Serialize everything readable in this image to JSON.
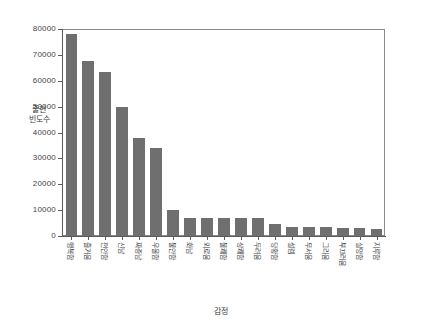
{
  "chart_data": {
    "type": "bar",
    "title": "",
    "xlabel": "감정",
    "ylabel": "출현\n빈도수",
    "ylabel_line1": "출현",
    "ylabel_line2": "빈도수",
    "ylim": [
      0,
      80000
    ],
    "yticks": [
      0,
      10000,
      20000,
      30000,
      40000,
      50000,
      60000,
      70000,
      80000
    ],
    "ytick_labels": [
      "0",
      "10000",
      "20000",
      "30000",
      "40000",
      "50000",
      "60000",
      "70000",
      "80000"
    ],
    "grid": false,
    "legend": "none",
    "bar_color": "#6f6f6f",
    "axis_color": "#5a5a5a",
    "categories": [
      "행복함",
      "즐거움",
      "편안함",
      "신남",
      "짜증남",
      "우울함",
      "불안함",
      "화남",
      "외로움",
      "불쾌함",
      "상쾌함",
      "두려움",
      "당황함",
      "설렘",
      "무서움",
      "그리움",
      "부끄러움",
      "실망함",
      "지루함"
    ],
    "values": [
      78000,
      67500,
      63500,
      50000,
      38000,
      34000,
      10000,
      7000,
      7000,
      7000,
      7000,
      7000,
      4800,
      3500,
      3400,
      3300,
      3200,
      3100,
      2900
    ]
  }
}
